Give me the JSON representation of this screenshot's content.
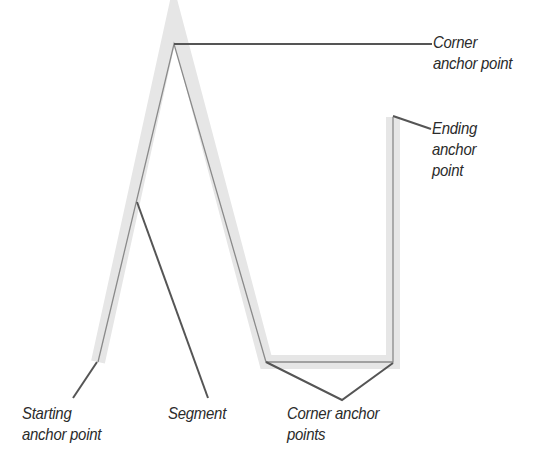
{
  "diagram": {
    "labels": {
      "corner_top": {
        "line1": "Corner",
        "line2": "anchor point"
      },
      "ending": {
        "line1": "Ending",
        "line2": "anchor",
        "line3": "point"
      },
      "starting": {
        "line1": "Starting",
        "line2": "anchor point"
      },
      "segment": {
        "line1": "Segment"
      },
      "corner_bottom": {
        "line1": "Corner anchor",
        "line2": "points"
      }
    },
    "colors": {
      "path": "#8a8a8a",
      "halo": "#e6e6e6",
      "callout": "#555555",
      "text": "#2b2b2b"
    }
  }
}
